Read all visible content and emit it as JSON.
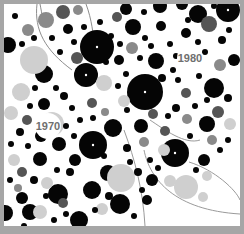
{
  "chart_data": {
    "type": "packed-circle",
    "title": "",
    "annotations": [
      {
        "text": "1980",
        "x": 190,
        "y": 62
      },
      {
        "text": "1970",
        "x": 48,
        "y": 130
      }
    ],
    "colors": {
      "frame": "#a6a6a6",
      "background": "#ffffff",
      "black": "#050505",
      "dark": "#555555",
      "mid": "#8a8a8a",
      "light": "#cfcfcf",
      "pale": "#e6e6e6"
    },
    "circles": [
      [
        97,
        47,
        17,
        "black"
      ],
      [
        145,
        92,
        18,
        "black"
      ],
      [
        93,
        145,
        14,
        "black"
      ],
      [
        175,
        153,
        14,
        "black"
      ],
      [
        86,
        75,
        12,
        "black"
      ],
      [
        79,
        220,
        9,
        "black"
      ],
      [
        44,
        74,
        9,
        "black"
      ],
      [
        214,
        88,
        10,
        "black"
      ],
      [
        133,
        27,
        8,
        "black"
      ],
      [
        228,
        10,
        12,
        "black"
      ],
      [
        113,
        128,
        9,
        "black"
      ],
      [
        40,
        159,
        7,
        "black"
      ],
      [
        58,
        194,
        10,
        "black"
      ],
      [
        108,
        173,
        8,
        "black"
      ],
      [
        30,
        212,
        8,
        "black"
      ],
      [
        92,
        190,
        9,
        "black"
      ],
      [
        198,
        14,
        9,
        "black"
      ],
      [
        207,
        124,
        8,
        "black"
      ],
      [
        59,
        144,
        7,
        "black"
      ],
      [
        126,
        9,
        6,
        "black"
      ],
      [
        182,
        4,
        6,
        "black"
      ],
      [
        160,
        6,
        7,
        "black"
      ],
      [
        68,
        29,
        5,
        "black"
      ],
      [
        8,
        45,
        8,
        "black"
      ],
      [
        5,
        213,
        8,
        "black"
      ],
      [
        44,
        104,
        6,
        "black"
      ],
      [
        156,
        61,
        8,
        "black"
      ],
      [
        141,
        126,
        7,
        "black"
      ],
      [
        152,
        180,
        6,
        "black"
      ],
      [
        120,
        204,
        10,
        "black"
      ],
      [
        147,
        200,
        5,
        "black"
      ],
      [
        204,
        160,
        6,
        "black"
      ],
      [
        186,
        33,
        5,
        "black"
      ],
      [
        234,
        60,
        6,
        "black"
      ],
      [
        161,
        26,
        5,
        "black"
      ],
      [
        119,
        60,
        5,
        "black"
      ],
      [
        41,
        136,
        6,
        "black"
      ],
      [
        75,
        160,
        6,
        "black"
      ],
      [
        22,
        198,
        6,
        "black"
      ],
      [
        63,
        12,
        7,
        "dark"
      ],
      [
        77,
        58,
        6,
        "dark"
      ],
      [
        117,
        17,
        5,
        "dark"
      ],
      [
        186,
        93,
        5,
        "dark"
      ],
      [
        218,
        112,
        6,
        "dark"
      ],
      [
        209,
        24,
        8,
        "dark"
      ],
      [
        153,
        114,
        5,
        "dark"
      ],
      [
        165,
        131,
        5,
        "dark"
      ],
      [
        63,
        203,
        5,
        "dark"
      ],
      [
        92,
        103,
        5,
        "dark"
      ],
      [
        27,
        120,
        5,
        "dark"
      ],
      [
        22,
        172,
        5,
        "dark"
      ],
      [
        28,
        30,
        6,
        "mid"
      ],
      [
        46,
        20,
        8,
        "mid"
      ],
      [
        78,
        10,
        5,
        "mid"
      ],
      [
        132,
        48,
        6,
        "mid"
      ],
      [
        220,
        65,
        6,
        "mid"
      ],
      [
        187,
        119,
        5,
        "mid"
      ],
      [
        212,
        140,
        5,
        "mid"
      ],
      [
        144,
        142,
        5,
        "mid"
      ],
      [
        105,
        112,
        4,
        "mid"
      ],
      [
        18,
        188,
        4,
        "mid"
      ],
      [
        34,
        60,
        14,
        "light"
      ],
      [
        52,
        124,
        12,
        "light"
      ],
      [
        121,
        178,
        14,
        "light"
      ],
      [
        186,
        187,
        12,
        "light"
      ],
      [
        21,
        92,
        9,
        "light"
      ],
      [
        104,
        83,
        8,
        "light"
      ],
      [
        170,
        181,
        6,
        "light"
      ],
      [
        40,
        212,
        7,
        "light"
      ],
      [
        164,
        150,
        6,
        "light"
      ],
      [
        203,
        197,
        5,
        "light"
      ],
      [
        124,
        101,
        6,
        "light"
      ],
      [
        11,
        113,
        7,
        "light"
      ],
      [
        230,
        124,
        6,
        "light"
      ],
      [
        14,
        160,
        6,
        "light"
      ],
      [
        47,
        183,
        6,
        "light"
      ],
      [
        102,
        209,
        6,
        "light"
      ],
      [
        207,
        176,
        5,
        "light"
      ],
      [
        15,
        16,
        3,
        "black"
      ],
      [
        22,
        44,
        3,
        "black"
      ],
      [
        34,
        38,
        3,
        "black"
      ],
      [
        52,
        38,
        3,
        "black"
      ],
      [
        60,
        52,
        3,
        "black"
      ],
      [
        74,
        42,
        3,
        "black"
      ],
      [
        111,
        36,
        3,
        "black"
      ],
      [
        120,
        44,
        3,
        "black"
      ],
      [
        145,
        38,
        3,
        "black"
      ],
      [
        151,
        46,
        3,
        "black"
      ],
      [
        170,
        44,
        3,
        "black"
      ],
      [
        176,
        56,
        3,
        "black"
      ],
      [
        198,
        42,
        3,
        "black"
      ],
      [
        205,
        52,
        3,
        "black"
      ],
      [
        222,
        40,
        4,
        "black"
      ],
      [
        229,
        30,
        3,
        "black"
      ],
      [
        173,
        70,
        3,
        "black"
      ],
      [
        162,
        78,
        4,
        "black"
      ],
      [
        178,
        80,
        3,
        "black"
      ],
      [
        199,
        76,
        3,
        "black"
      ],
      [
        207,
        100,
        3,
        "black"
      ],
      [
        228,
        98,
        4,
        "black"
      ],
      [
        195,
        106,
        3,
        "black"
      ],
      [
        176,
        108,
        4,
        "black"
      ],
      [
        168,
        116,
        3,
        "black"
      ],
      [
        127,
        110,
        3,
        "black"
      ],
      [
        118,
        86,
        3,
        "black"
      ],
      [
        106,
        62,
        3,
        "black"
      ],
      [
        93,
        118,
        3,
        "black"
      ],
      [
        72,
        108,
        3,
        "black"
      ],
      [
        64,
        96,
        4,
        "black"
      ],
      [
        56,
        88,
        3,
        "black"
      ],
      [
        30,
        106,
        3,
        "black"
      ],
      [
        20,
        132,
        4,
        "black"
      ],
      [
        11,
        144,
        3,
        "black"
      ],
      [
        28,
        146,
        3,
        "black"
      ],
      [
        66,
        126,
        3,
        "black"
      ],
      [
        74,
        136,
        3,
        "black"
      ],
      [
        80,
        120,
        3,
        "black"
      ],
      [
        104,
        156,
        3,
        "black"
      ],
      [
        127,
        148,
        4,
        "black"
      ],
      [
        130,
        162,
        3,
        "black"
      ],
      [
        138,
        172,
        4,
        "black"
      ],
      [
        158,
        168,
        3,
        "black"
      ],
      [
        142,
        190,
        3,
        "black"
      ],
      [
        109,
        196,
        4,
        "black"
      ],
      [
        70,
        172,
        4,
        "black"
      ],
      [
        57,
        170,
        3,
        "black"
      ],
      [
        34,
        180,
        4,
        "black"
      ],
      [
        10,
        180,
        3,
        "black"
      ],
      [
        46,
        196,
        3,
        "black"
      ],
      [
        24,
        226,
        3,
        "black"
      ],
      [
        54,
        220,
        3,
        "black"
      ],
      [
        66,
        214,
        3,
        "black"
      ],
      [
        95,
        210,
        3,
        "black"
      ],
      [
        134,
        216,
        3,
        "black"
      ],
      [
        150,
        160,
        3,
        "black"
      ],
      [
        190,
        136,
        3,
        "black"
      ],
      [
        220,
        150,
        3,
        "black"
      ],
      [
        228,
        140,
        3,
        "black"
      ],
      [
        196,
        170,
        3,
        "black"
      ],
      [
        35,
        88,
        3,
        "black"
      ],
      [
        84,
        27,
        3,
        "black"
      ],
      [
        100,
        22,
        3,
        "black"
      ],
      [
        140,
        58,
        3,
        "black"
      ],
      [
        126,
        74,
        3,
        "black"
      ],
      [
        188,
        20,
        3,
        "black"
      ],
      [
        214,
        6,
        3,
        "black"
      ],
      [
        144,
        12,
        3,
        "black"
      ]
    ]
  }
}
